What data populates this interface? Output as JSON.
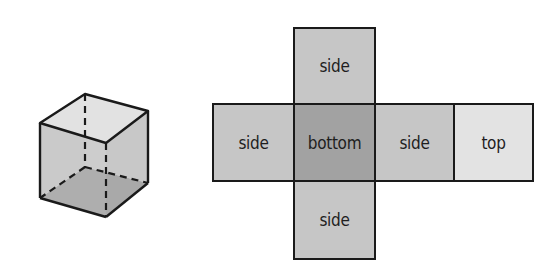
{
  "diagram": {
    "cube": {
      "label": "cube",
      "colors": {
        "top": "#e0e0e0",
        "side": "#cbcbcb",
        "bottom": "#8e8e8e",
        "stroke": "#1a1a1a"
      }
    },
    "net": {
      "faces": [
        {
          "id": "side-top",
          "label": "side",
          "color": "#c6c6c6",
          "x": 293,
          "y": 27,
          "w": 83,
          "h": 78
        },
        {
          "id": "side-left",
          "label": "side",
          "color": "#c6c6c6",
          "x": 212,
          "y": 103,
          "w": 83,
          "h": 79
        },
        {
          "id": "bottom",
          "label": "bottom",
          "color": "#a2a2a2",
          "x": 293,
          "y": 103,
          "w": 83,
          "h": 79
        },
        {
          "id": "side-right",
          "label": "side",
          "color": "#c6c6c6",
          "x": 374,
          "y": 103,
          "w": 81,
          "h": 79
        },
        {
          "id": "top",
          "label": "top",
          "color": "#e3e3e3",
          "x": 453,
          "y": 103,
          "w": 81,
          "h": 79
        },
        {
          "id": "side-bottom",
          "label": "side",
          "color": "#c6c6c6",
          "x": 293,
          "y": 180,
          "w": 83,
          "h": 80
        }
      ]
    }
  }
}
